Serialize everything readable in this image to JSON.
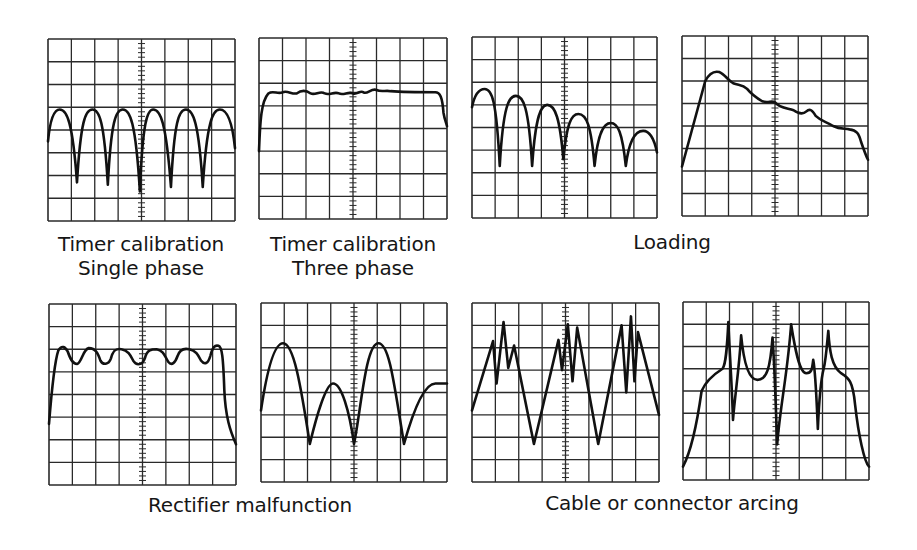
{
  "figure": {
    "grid": {
      "columns": 8,
      "rows": 8,
      "center_axis_ticks": true
    },
    "colors": {
      "trace": "#111111",
      "grid": "#2a2a2a",
      "background": "#ffffff"
    }
  },
  "captions": {
    "timer_single": [
      "Timer calibration",
      "Single phase"
    ],
    "timer_three": [
      "Timer calibration",
      "Three phase"
    ],
    "loading": "Loading",
    "rectifier": "Rectifier malfunction",
    "arcing": "Cable or connector arcing"
  },
  "panels": [
    {
      "id": "timer-single-phase",
      "group": "Timer calibration Single phase",
      "box": [
        48,
        39,
        187,
        182
      ],
      "trace": "M0,4.5 C0.1,3.4 0.3,3.1 0.5,3.1 C0.8,3.1 1.05,3.6 1.24,6.3 C1.4,3.6 1.6,3.1 1.9,3.1 C2.2,3.1 2.4,3.6 2.56,6.4 C2.7,3.6 2.9,3.1 3.2,3.1 C3.5,3.1 3.75,3.6 3.93,6.7 C4.05,3.6 4.25,3.1 4.5,3.1 C4.8,3.1 5.05,3.6 5.26,6.5 C5.4,3.6 5.6,3.1 5.9,3.1 C6.2,3.1 6.45,3.6 6.62,6.5 C6.8,3.6 7.05,3.1 7.35,3.1 C7.7,3.1 7.9,3.8 8,4.8"
    },
    {
      "id": "timer-three-phase",
      "group": "Timer calibration Three phase",
      "box": [
        259,
        38,
        188,
        181
      ],
      "trace": "M0,5.0 C0.05,3.6 0.1,2.8 0.4,2.45 C0.6,2.3 0.8,2.5 1.0,2.4 C1.2,2.3 1.4,2.5 1.6,2.45 C1.8,2.3 2.0,2.3 2.2,2.45 C2.4,2.55 2.6,2.3 2.8,2.45 C3.0,2.55 3.2,2.35 3.4,2.45 C3.6,2.55 3.8,2.35 4.0,2.45 C4.2,2.5 4.3,2.3 4.45,2.4 C4.6,2.5 4.8,2.2 5.0,2.3 C5.2,2.4 5.4,2.3 5.6,2.35 C6.2,2.4 7.2,2.4 7.5,2.4 C7.7,2.4 7.8,2.6 7.85,3.3 C7.9,3.6 7.95,3.7 8,3.9"
    },
    {
      "id": "loading-decaying",
      "group": "Loading",
      "box": [
        472,
        37,
        185,
        181
      ],
      "trace": "M0,3.1 C0.1,2.6 0.3,2.3 0.55,2.3 C0.85,2.3 1.05,2.7 1.2,5.7 C1.35,3.0 1.6,2.6 1.9,2.6 C2.2,2.6 2.45,3.0 2.6,5.7 C2.75,3.4 3.0,3.0 3.25,3.0 C3.6,3.0 3.8,3.6 3.95,5.4 C4.1,3.8 4.3,3.4 4.6,3.4 C4.95,3.4 5.15,3.9 5.3,5.7 C5.45,4.2 5.7,3.8 6.0,3.8 C6.3,3.8 6.5,4.2 6.65,5.7 C6.8,4.5 7.1,4.15 7.4,4.15 C7.7,4.15 7.9,4.6 8,5.1"
    },
    {
      "id": "loading-sloped",
      "group": "Loading",
      "box": [
        682,
        36,
        186,
        180
      ],
      "trace": "M0,5.8 C0.3,4.7 0.6,3.5 1.0,2.0 C1.2,1.6 1.4,1.55 1.6,1.6 C1.85,1.7 1.95,1.95 2.2,2.1 C2.45,2.2 2.6,2.15 2.8,2.35 C3.0,2.6 3.2,2.75 3.45,2.9 C3.7,3.0 3.85,2.85 4.0,2.95 C4.2,3.2 4.5,3.2 4.8,3.3 C5.0,3.45 5.2,3.5 5.35,3.35 C5.5,3.2 5.6,3.3 5.75,3.55 C6.0,3.8 6.2,3.8 6.5,4.0 C6.8,4.15 7.0,4.1 7.2,4.15 C7.5,4.2 7.6,4.3 7.7,4.7 C7.8,5.0 7.9,5.3 8,5.5"
    },
    {
      "id": "rectifier-flat",
      "group": "Rectifier malfunction",
      "box": [
        49,
        304,
        187,
        181
      ],
      "trace": "M0,5.3 C0.1,4.0 0.25,2.5 0.4,2.05 C0.55,1.8 0.7,1.9 0.8,2.1 C0.9,2.4 1.0,2.65 1.2,2.65 C1.4,2.6 1.45,2.0 1.7,1.95 C2.0,1.95 2.1,2.2 2.2,2.5 C2.3,2.7 2.55,2.7 2.65,2.4 C2.75,2.0 2.9,1.95 3.1,2.0 C3.4,2.05 3.5,2.3 3.6,2.5 C3.75,2.75 4.0,2.7 4.1,2.4 C4.2,2.0 4.4,2.0 4.6,2.0 C4.9,2.05 4.95,2.3 5.1,2.55 C5.25,2.75 5.4,2.6 5.5,2.3 C5.6,2.0 5.8,1.95 6.0,2.0 C6.3,2.05 6.4,2.3 6.5,2.5 C6.65,2.7 6.8,2.65 6.9,2.3 C7.0,1.9 7.1,1.8 7.25,1.85 C7.4,1.9 7.45,2.3 7.5,3.8 C7.55,5.0 7.75,5.6 8,6.2"
    },
    {
      "id": "rectifier-irregular",
      "group": "Rectifier malfunction",
      "box": [
        261,
        303,
        186,
        179
      ],
      "trace": "M0,4.8 C0.2,3.4 0.5,1.8 0.95,1.8 C1.4,1.8 1.7,3.6 2.1,6.3 C2.4,5.0 2.8,3.6 3.1,3.6 C3.45,3.6 3.8,4.8 4.0,6.3 C4.3,4.8 4.5,1.8 5.05,1.8 C5.5,1.8 5.7,3.4 6.15,6.3 C6.5,5.0 7.0,3.6 7.5,3.6 C7.8,3.6 7.9,3.6 8,3.6"
    },
    {
      "id": "arcing-spiky",
      "group": "Cable or connector arcing",
      "box": [
        472,
        303,
        187,
        179
      ],
      "trace": "M0,4.8 L0.9,1.7 L1.05,3.6 L1.35,0.85 L1.55,2.9 L1.8,1.9 L2.65,6.3 L3.7,1.65 L3.85,3.0 L4.1,0.95 L4.3,3.5 L4.5,1.1 L5.4,6.3 L6.4,1.0 L6.6,4.0 L6.8,0.6 L6.95,3.5 L7.1,1.3 L8,5.0"
    },
    {
      "id": "arcing-resonant",
      "group": "Cable or connector arcing",
      "box": [
        683,
        302,
        186,
        178
      ],
      "trace": "M0,7.4 C0.3,6.8 0.6,5.5 0.8,4.0 C1.0,3.5 1.4,3.2 1.7,3.0 C1.85,2.8 1.9,2.0 1.95,0.9 C2.0,2.2 2.1,3.6 2.15,5.3 C2.25,4.0 2.4,3.2 2.5,1.5 C2.6,2.6 2.8,3.5 3.2,3.5 C3.6,3.5 3.75,3.0 3.85,1.6 C3.95,3.0 4.0,5.0 4.05,6.4 C4.2,4.5 4.5,3.2 4.65,1.0 C4.8,2.0 5.0,3.2 5.3,3.2 C5.55,3.2 5.55,3.0 5.6,2.6 C5.7,3.1 5.75,4.5 5.8,5.7 C5.85,4.5 5.95,3.4 6.05,3.0 C6.15,2.6 6.2,1.8 6.25,1.3 C6.3,2.2 6.4,2.9 6.8,3.2 C7.1,3.4 7.3,3.5 7.4,4.6 C7.55,6.0 7.8,7.2 8,7.4"
    }
  ],
  "caption_layout": {
    "timer_single": {
      "center_x": 141,
      "top": 232
    },
    "timer_three": {
      "center_x": 353,
      "top": 232
    },
    "loading": {
      "center_x": 672,
      "top": 230
    },
    "rectifier": {
      "center_x": 250,
      "top": 493
    },
    "arcing": {
      "center_x": 672,
      "top": 491
    }
  }
}
